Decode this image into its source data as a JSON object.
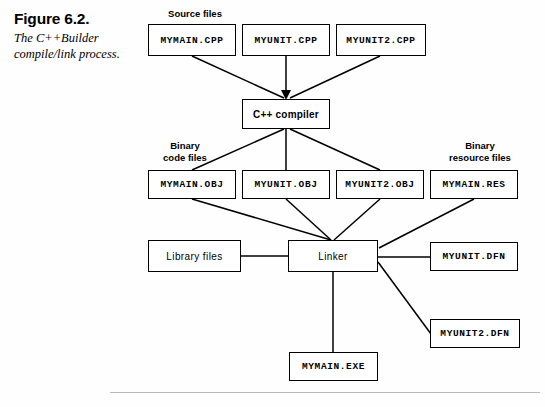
{
  "figure": {
    "number": "Figure 6.2.",
    "caption": "The C++Builder compile/link process."
  },
  "group_captions": {
    "source_files": "Source files",
    "binary_code_files": "Binary\ncode files",
    "binary_resource_files": "Binary\nresource files"
  },
  "nodes": {
    "mymain_cpp": "MYMAIN.CPP",
    "myunit_cpp": "MYUNIT.CPP",
    "myunit2_cpp": "MYUNIT2.CPP",
    "compiler": "C++ compiler",
    "mymain_obj": "MYMAIN.OBJ",
    "myunit_obj": "MYUNIT.OBJ",
    "myunit2_obj": "MYUNIT2.OBJ",
    "mymain_res": "MYMAIN.RES",
    "library_files": "Library files",
    "linker": "Linker",
    "myunit_dfn": "MYUNIT.DFN",
    "myunit2_dfn": "MYUNIT2.DFN",
    "mymain_exe": "MYMAIN.EXE"
  },
  "colors": {
    "ink": "#000000",
    "page": "#fefefe",
    "rule": "#b9b9b9"
  }
}
